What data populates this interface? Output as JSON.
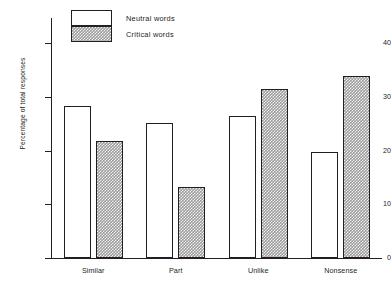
{
  "chart_data": {
    "type": "bar",
    "title": "",
    "subtitle": "",
    "xlabel": "",
    "ylabel": "Percentage of total responses",
    "categories": [
      "Similar",
      "Part",
      "Unlike",
      "Nonsense"
    ],
    "series": [
      {
        "name": "Neutral words",
        "values": [
          28.3,
          25.2,
          26.4,
          19.7
        ],
        "fill": "white",
        "pattern": "none"
      },
      {
        "name": "Critical words",
        "values": [
          21.7,
          13.2,
          31.4,
          33.8
        ],
        "fill": "#9b9b9b",
        "pattern": "checkered-hatch"
      }
    ],
    "ylim": [
      0,
      44
    ],
    "yticks": [
      0,
      10,
      20,
      30,
      40
    ],
    "ytick_labels": [
      "0",
      "10",
      "20",
      "30",
      "40"
    ],
    "grid": false,
    "legend_position": "top-left-inside",
    "axis_color": "#231f20",
    "background": "#ffffff"
  },
  "legend": {
    "items": [
      {
        "label": "Neutral words",
        "swatch": "neutral"
      },
      {
        "label": "Critical words",
        "swatch": "critical"
      }
    ]
  },
  "axes": {
    "y_title": "Percentage of total responses"
  }
}
